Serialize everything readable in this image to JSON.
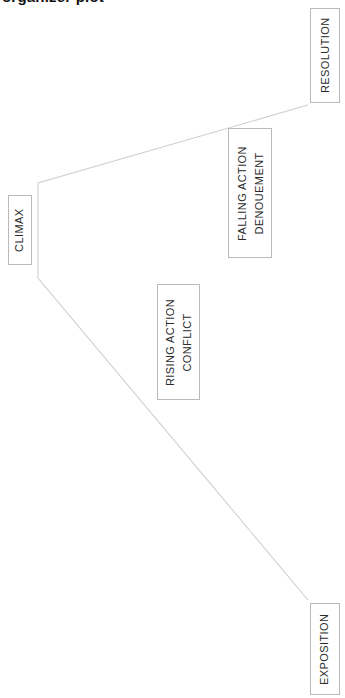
{
  "page": {
    "caption_partial": "organizer  plot",
    "background_color": "#ffffff"
  },
  "diagram": {
    "name": "plot-diagram",
    "type": "freytag-pyramid",
    "orientation": "rotated-90-counterclockwise",
    "line_color": "#cfcfcf",
    "box_border_color": "#b9b9b9",
    "text_color": "#2b2b2b",
    "stages": [
      {
        "id": "exposition",
        "label": "EXPOSITION",
        "sublabel": "",
        "box": {
          "x": 310,
          "y": 603,
          "w": 30,
          "h": 92
        }
      },
      {
        "id": "rising-action",
        "label": "RISING ACTION",
        "sublabel": "CONFLICT",
        "box": {
          "x": 157,
          "y": 284,
          "w": 43,
          "h": 116
        }
      },
      {
        "id": "climax",
        "label": "CLIMAX",
        "sublabel": "",
        "box": {
          "x": 8,
          "y": 195,
          "w": 24,
          "h": 70
        }
      },
      {
        "id": "falling-action",
        "label": "FALLING ACTION",
        "sublabel": "DENOUEMENT",
        "box": {
          "x": 228,
          "y": 128,
          "w": 44,
          "h": 130
        }
      },
      {
        "id": "resolution",
        "label": "RESOLUTION",
        "sublabel": "",
        "box": {
          "x": 310,
          "y": 8,
          "w": 30,
          "h": 95
        }
      }
    ],
    "path_points": "308,600 38,278 38,183 308,105"
  }
}
